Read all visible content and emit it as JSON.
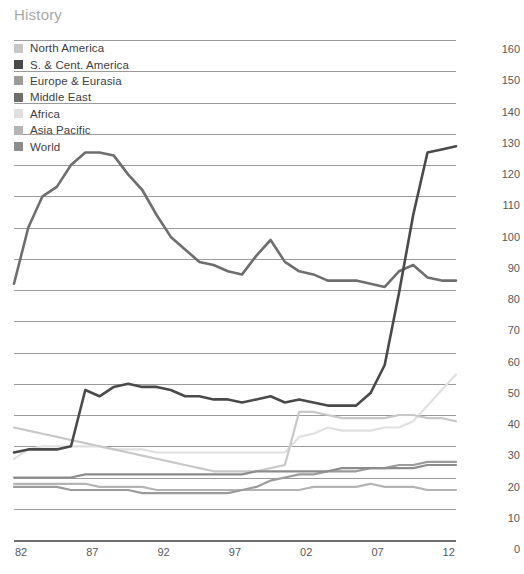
{
  "panel": {
    "title": "History"
  },
  "legend": {
    "items": [
      {
        "label": "North America",
        "color": "#c8c8c8"
      },
      {
        "label": "S. & Cent. America",
        "color": "#4a4a4a"
      },
      {
        "label": "Europe & Eurasia",
        "color": "#9b9b9b"
      },
      {
        "label": "Middle East",
        "color": "#6e6e6e"
      },
      {
        "label": "Africa",
        "color": "#e0e0e0"
      },
      {
        "label": "Asia Pacific",
        "color": "#b4b4b4"
      },
      {
        "label": "World",
        "color": "#8c8c8c"
      }
    ]
  },
  "axes": {
    "y_ticks": [
      "160",
      "150",
      "140",
      "130",
      "120",
      "110",
      "100",
      "90",
      "80",
      "70",
      "60",
      "50",
      "40",
      "30",
      "20",
      "10",
      "0"
    ],
    "x_ticks": [
      "82",
      "87",
      "92",
      "97",
      "02",
      "07",
      "12"
    ]
  },
  "chart_data": {
    "type": "line",
    "title": "History",
    "xlabel": "",
    "ylabel": "",
    "ylim": [
      0,
      160
    ],
    "xlim": [
      1982,
      2013
    ],
    "grid": true,
    "legend_position": "top-left",
    "x": [
      1982,
      1983,
      1984,
      1985,
      1986,
      1987,
      1988,
      1989,
      1990,
      1991,
      1992,
      1993,
      1994,
      1995,
      1996,
      1997,
      1998,
      1999,
      2000,
      2001,
      2002,
      2003,
      2004,
      2005,
      2006,
      2007,
      2008,
      2009,
      2010,
      2011,
      2012,
      2013
    ],
    "series": [
      {
        "name": "North America",
        "color": "#c8c8c8",
        "values": [
          36,
          35,
          34,
          33,
          32,
          31,
          30,
          29,
          28,
          27,
          26,
          25,
          24,
          23,
          22,
          22,
          22,
          22,
          23,
          24,
          41,
          41,
          40,
          39,
          39,
          39,
          39,
          40,
          40,
          39,
          39,
          38
        ]
      },
      {
        "name": "S. & Cent. America",
        "color": "#4a4a4a",
        "values": [
          28,
          29,
          29,
          29,
          30,
          48,
          46,
          49,
          50,
          49,
          49,
          48,
          46,
          46,
          45,
          45,
          44,
          45,
          46,
          44,
          45,
          44,
          43,
          43,
          43,
          47,
          56,
          79,
          104,
          124,
          125,
          126
        ]
      },
      {
        "name": "Europe & Eurasia",
        "color": "#9b9b9b",
        "values": [
          17,
          17,
          17,
          17,
          16,
          16,
          16,
          16,
          16,
          15,
          15,
          15,
          15,
          15,
          15,
          15,
          16,
          17,
          19,
          20,
          21,
          21,
          22,
          22,
          22,
          23,
          23,
          24,
          24,
          25,
          25,
          25
        ]
      },
      {
        "name": "Middle East",
        "color": "#6e6e6e",
        "values": [
          82,
          100,
          110,
          113,
          120,
          124,
          124,
          123,
          117,
          112,
          104,
          97,
          93,
          89,
          88,
          86,
          85,
          91,
          96,
          89,
          86,
          85,
          83,
          83,
          83,
          82,
          81,
          86,
          88,
          84,
          83,
          83
        ]
      },
      {
        "name": "Africa",
        "color": "#e0e0e0",
        "values": [
          26,
          29,
          30,
          30,
          30,
          30,
          30,
          29,
          29,
          29,
          28,
          28,
          28,
          28,
          28,
          28,
          28,
          28,
          28,
          28,
          33,
          34,
          36,
          35,
          35,
          35,
          36,
          36,
          38,
          43,
          48,
          53
        ]
      },
      {
        "name": "Asia Pacific",
        "color": "#b4b4b4",
        "values": [
          18,
          18,
          18,
          18,
          18,
          18,
          17,
          17,
          17,
          17,
          16,
          16,
          16,
          16,
          16,
          16,
          16,
          16,
          16,
          16,
          16,
          17,
          17,
          17,
          17,
          18,
          17,
          17,
          17,
          16,
          16,
          16
        ]
      },
      {
        "name": "World",
        "color": "#8c8c8c",
        "values": [
          20,
          20,
          20,
          20,
          20,
          21,
          21,
          21,
          21,
          21,
          21,
          21,
          21,
          21,
          21,
          21,
          21,
          22,
          22,
          22,
          22,
          22,
          22,
          23,
          23,
          23,
          23,
          23,
          23,
          24,
          24,
          24
        ]
      }
    ]
  },
  "footnote": {
    "text": ""
  }
}
